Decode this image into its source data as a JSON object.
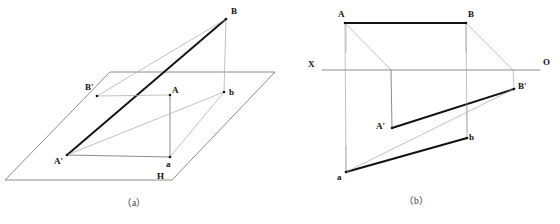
{
  "figure": {
    "captions": [
      {
        "name": "caption-a",
        "text": "（a）",
        "x": 122,
        "y": 199
      },
      {
        "name": "caption-b",
        "text": "（b）",
        "x": 404,
        "y": 197
      }
    ]
  },
  "colors": {
    "bold_line": "#111111",
    "thin_line": "#6e6e6e",
    "light_line": "#a8a8a8",
    "background": "#ffffff",
    "text": "#111111"
  },
  "panel_a": {
    "name": "pictorial-view",
    "labels": [
      {
        "name": "label-B",
        "text": "B",
        "x": 231,
        "y": 7
      },
      {
        "name": "label-Bprime",
        "text": "B'",
        "x": 85,
        "y": 83
      },
      {
        "name": "label-A",
        "text": "A",
        "x": 172,
        "y": 86
      },
      {
        "name": "label-b",
        "text": "b",
        "x": 229,
        "y": 88
      },
      {
        "name": "label-Aprime",
        "text": "A'",
        "x": 54,
        "y": 157
      },
      {
        "name": "label-a",
        "text": "a",
        "x": 166,
        "y": 160
      },
      {
        "name": "label-H",
        "text": "H",
        "x": 157,
        "y": 172
      }
    ],
    "plane": {
      "name": "plane-H",
      "points": "110,72 275,72 172,180 5,180"
    },
    "points": {
      "A": {
        "x": 170,
        "y": 95
      },
      "B": {
        "x": 226,
        "y": 19
      },
      "a": {
        "x": 170,
        "y": 157
      },
      "b": {
        "x": 224,
        "y": 92
      },
      "Ap": {
        "x": 67,
        "y": 155
      },
      "Bp": {
        "x": 97,
        "y": 96
      }
    },
    "segments": [
      {
        "name": "segment-Aprime-Bprime-extended",
        "weight": "bold",
        "from": "Ap",
        "to": "B"
      },
      {
        "name": "segment-A-to-a",
        "weight": "thin",
        "from": "A",
        "to": "a"
      },
      {
        "name": "segment-B-to-b",
        "weight": "light",
        "from": "B",
        "to": "b"
      },
      {
        "name": "segment-a-to-b",
        "weight": "light",
        "from": "a",
        "to": "b"
      },
      {
        "name": "segment-Aprime-to-a",
        "weight": "thin",
        "from": "Ap",
        "to": "a"
      },
      {
        "name": "segment-Aprime-to-b",
        "weight": "light",
        "from": "Ap",
        "to": "b"
      },
      {
        "name": "segment-Bprime-to-A",
        "weight": "light",
        "from": "Bp",
        "to": "A"
      },
      {
        "name": "segment-Bprime-to-B",
        "weight": "light",
        "from": "Bp",
        "to": "B"
      }
    ]
  },
  "panel_b": {
    "name": "orthographic-view",
    "axis": {
      "name": "axis-XO",
      "x1": 322,
      "x2": 540,
      "y": 70,
      "start_label": "X",
      "end_label": "O"
    },
    "labels": [
      {
        "name": "label-X",
        "text": "X",
        "x": 308,
        "y": 60
      },
      {
        "name": "label-O",
        "text": "O",
        "x": 543,
        "y": 58
      },
      {
        "name": "label-A",
        "text": "A",
        "x": 338,
        "y": 10
      },
      {
        "name": "label-B",
        "text": "B",
        "x": 468,
        "y": 10
      },
      {
        "name": "label-Bprime",
        "text": "B'",
        "x": 518,
        "y": 82
      },
      {
        "name": "label-Aprime",
        "text": "A'",
        "x": 376,
        "y": 122
      },
      {
        "name": "label-b",
        "text": "b",
        "x": 469,
        "y": 133
      },
      {
        "name": "label-a",
        "text": "a",
        "x": 337,
        "y": 173
      }
    ],
    "points": {
      "A": {
        "x": 345,
        "y": 23
      },
      "B": {
        "x": 466,
        "y": 23
      },
      "Ap": {
        "x": 392,
        "y": 128
      },
      "Bp": {
        "x": 514,
        "y": 89
      },
      "a": {
        "x": 346,
        "y": 172
      },
      "b": {
        "x": 467,
        "y": 138
      },
      "axA": {
        "x": 391,
        "y": 70
      },
      "axB": {
        "x": 513,
        "y": 70
      }
    },
    "segments": [
      {
        "name": "segment-A-B",
        "weight": "bold",
        "from": "A",
        "to": "B"
      },
      {
        "name": "segment-Aprime-Bprime",
        "weight": "bold",
        "from": "Ap",
        "to": "Bp"
      },
      {
        "name": "segment-a-b",
        "weight": "bold",
        "from": "a",
        "to": "b"
      },
      {
        "name": "segment-A-to-axis",
        "weight": "light",
        "from": "A",
        "to": "axA"
      },
      {
        "name": "segment-B-to-axis",
        "weight": "light",
        "from": "B",
        "to": "axB"
      },
      {
        "name": "segment-axis-to-Aprime",
        "weight": "thin",
        "from": "axA",
        "to": "Ap"
      },
      {
        "name": "segment-axis-to-Bprime",
        "weight": "light",
        "from": "axB",
        "to": "Bp"
      },
      {
        "name": "segment-A-to-a",
        "weight": "light",
        "from": "A",
        "to": "a"
      },
      {
        "name": "segment-B-to-b",
        "weight": "light",
        "from": "B",
        "to": "b"
      },
      {
        "name": "segment-a-to-Bprime",
        "weight": "light",
        "from": "a",
        "to": "Bp"
      }
    ],
    "ticks": [
      {
        "name": "tick-below-A",
        "x": 346,
        "y1": 26,
        "y2": 52
      },
      {
        "name": "tick-below-B",
        "x": 466,
        "y1": 26,
        "y2": 52
      },
      {
        "name": "tick-below-b",
        "x": 467,
        "y1": 106,
        "y2": 133
      },
      {
        "name": "tick-above-a",
        "x": 346,
        "y1": 146,
        "y2": 170
      }
    ]
  }
}
